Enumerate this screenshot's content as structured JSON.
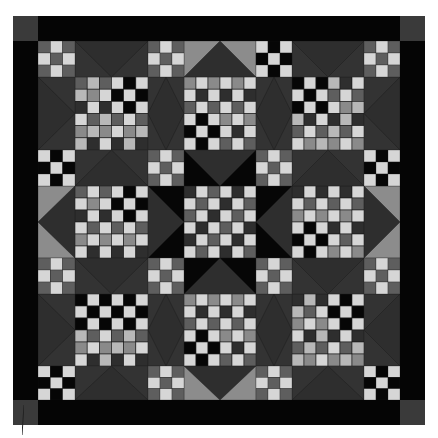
{
  "image": {
    "subject": "patchwork quilt (grayscale photograph)",
    "width": 438,
    "height": 438
  },
  "palette": {
    "black": "#060606",
    "dark": "#2e2e2e",
    "sash": "#333333",
    "mid": "#5e5e5e",
    "midlight": "#8a8a8a",
    "light": "#b8b8b8",
    "white": "#d6d6d6",
    "triangle_light": "#8c8c8c",
    "border": "#050505",
    "corner": "#3a3a3a"
  },
  "quilt": {
    "grid": {
      "rows": 7,
      "cols": 7,
      "col_widths": [
        37,
        73,
        36,
        72,
        36,
        72,
        36
      ],
      "row_heights": [
        36,
        73,
        36,
        72,
        36,
        72,
        34
      ]
    },
    "nine_patch_styles": {
      "gray": [
        "mid",
        "white",
        "mid",
        "white",
        "mid",
        "white",
        "mid",
        "white",
        "mid"
      ],
      "black": [
        "white",
        "black",
        "white",
        "black",
        "white",
        "black",
        "white",
        "black",
        "white"
      ]
    },
    "nine_patches": [
      {
        "r": 0,
        "c": 0,
        "style": "gray"
      },
      {
        "r": 0,
        "c": 2,
        "style": "gray"
      },
      {
        "r": 0,
        "c": 4,
        "style": "black"
      },
      {
        "r": 0,
        "c": 6,
        "style": "gray"
      },
      {
        "r": 2,
        "c": 0,
        "style": "black"
      },
      {
        "r": 2,
        "c": 2,
        "style": "gray"
      },
      {
        "r": 2,
        "c": 4,
        "style": "gray"
      },
      {
        "r": 2,
        "c": 6,
        "style": "black"
      },
      {
        "r": 4,
        "c": 0,
        "style": "gray"
      },
      {
        "r": 4,
        "c": 2,
        "style": "gray"
      },
      {
        "r": 4,
        "c": 4,
        "style": "gray"
      },
      {
        "r": 4,
        "c": 6,
        "style": "gray"
      },
      {
        "r": 6,
        "c": 0,
        "style": "black"
      },
      {
        "r": 6,
        "c": 2,
        "style": "gray"
      },
      {
        "r": 6,
        "c": 4,
        "style": "gray"
      },
      {
        "r": 6,
        "c": 6,
        "style": "black"
      }
    ],
    "checker_blocks": [
      {
        "r": 1,
        "c": 1,
        "black_quadrant": "top-right"
      },
      {
        "r": 1,
        "c": 3,
        "black_quadrant": "bottom-left"
      },
      {
        "r": 1,
        "c": 5,
        "black_quadrant": "top-left"
      },
      {
        "r": 3,
        "c": 1,
        "black_quadrant": "top-right"
      },
      {
        "r": 3,
        "c": 3,
        "black_quadrant": "none"
      },
      {
        "r": 3,
        "c": 5,
        "black_quadrant": "bottom-left"
      },
      {
        "r": 5,
        "c": 1,
        "black_quadrant": "top"
      },
      {
        "r": 5,
        "c": 3,
        "black_quadrant": "bottom-left"
      },
      {
        "r": 5,
        "c": 5,
        "black_quadrant": "top-right"
      }
    ],
    "sashing": [
      {
        "r": 0,
        "c": 1,
        "point": "down",
        "bg": "sash",
        "tri": "dark"
      },
      {
        "r": 0,
        "c": 3,
        "point": "up",
        "bg": "triangle_light",
        "tri": "dark"
      },
      {
        "r": 0,
        "c": 5,
        "point": "down",
        "bg": "sash",
        "tri": "dark"
      },
      {
        "r": 1,
        "c": 0,
        "point": "right",
        "bg": "sash",
        "tri": "dark"
      },
      {
        "r": 1,
        "c": 2,
        "point": "diamond",
        "bg": "sash",
        "tri": "dark"
      },
      {
        "r": 1,
        "c": 4,
        "point": "diamond",
        "bg": "sash",
        "tri": "dark"
      },
      {
        "r": 1,
        "c": 6,
        "point": "left",
        "bg": "sash",
        "tri": "dark"
      },
      {
        "r": 2,
        "c": 1,
        "point": "up",
        "bg": "sash",
        "tri": "dark"
      },
      {
        "r": 2,
        "c": 3,
        "point": "down",
        "bg": "black",
        "tri": "dark"
      },
      {
        "r": 2,
        "c": 5,
        "point": "up",
        "bg": "sash",
        "tri": "dark"
      },
      {
        "r": 3,
        "c": 0,
        "point": "left",
        "bg": "triangle_light",
        "tri": "dark"
      },
      {
        "r": 3,
        "c": 2,
        "point": "right",
        "bg": "black",
        "tri": "dark"
      },
      {
        "r": 3,
        "c": 4,
        "point": "left",
        "bg": "black",
        "tri": "dark"
      },
      {
        "r": 3,
        "c": 6,
        "point": "right",
        "bg": "triangle_light",
        "tri": "dark"
      },
      {
        "r": 4,
        "c": 1,
        "point": "down",
        "bg": "sash",
        "tri": "dark"
      },
      {
        "r": 4,
        "c": 3,
        "point": "up",
        "bg": "black",
        "tri": "dark"
      },
      {
        "r": 4,
        "c": 5,
        "point": "down",
        "bg": "sash",
        "tri": "dark"
      },
      {
        "r": 5,
        "c": 0,
        "point": "right",
        "bg": "sash",
        "tri": "dark"
      },
      {
        "r": 5,
        "c": 2,
        "point": "diamond",
        "bg": "sash",
        "tri": "dark"
      },
      {
        "r": 5,
        "c": 4,
        "point": "diamond",
        "bg": "sash",
        "tri": "dark"
      },
      {
        "r": 5,
        "c": 6,
        "point": "left",
        "bg": "sash",
        "tri": "dark"
      },
      {
        "r": 6,
        "c": 1,
        "point": "up",
        "bg": "sash",
        "tri": "dark"
      },
      {
        "r": 6,
        "c": 3,
        "point": "down",
        "bg": "triangle_light",
        "tri": "dark"
      },
      {
        "r": 6,
        "c": 5,
        "point": "up",
        "bg": "sash",
        "tri": "dark"
      }
    ]
  }
}
